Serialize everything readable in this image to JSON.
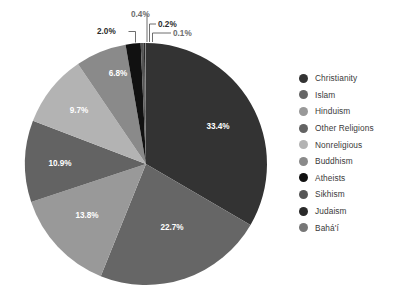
{
  "chart_data": {
    "type": "pie",
    "title": "",
    "subtitle": "",
    "xlabel": "",
    "ylabel": "",
    "grid": false,
    "legend_position": "right",
    "start_angle_deg": 0,
    "direction": "clockwise",
    "units": "percent",
    "categories": [
      "Christianity",
      "Islam",
      "Hinduism",
      "Other Religions",
      "Nonreligious",
      "Buddhism",
      "Atheists",
      "Sikhism",
      "Judaism",
      "Bahá'í"
    ],
    "values": [
      33.4,
      22.7,
      13.8,
      10.9,
      9.7,
      6.8,
      2.0,
      0.4,
      0.2,
      0.1
    ],
    "labels": [
      "33.4%",
      "22.7%",
      "13.8%",
      "10.9%",
      "9.7%",
      "6.8%",
      "2.0%",
      "0.4%",
      "0.2%",
      "0.1%"
    ],
    "colors": [
      "#333333",
      "#666666",
      "#999999",
      "#636363",
      "#b3b3b3",
      "#8a8a8a",
      "#111111",
      "#555555",
      "#2a2a2a",
      "#777777"
    ],
    "label_placement": [
      "inside",
      "inside",
      "inside",
      "inside",
      "inside",
      "inside",
      "outside",
      "outside",
      "outside",
      "outside"
    ]
  },
  "legend": {
    "items": [
      {
        "label": "Christianity",
        "color": "#333333"
      },
      {
        "label": "Islam",
        "color": "#666666"
      },
      {
        "label": "Hinduism",
        "color": "#999999"
      },
      {
        "label": "Other Religions",
        "color": "#636363"
      },
      {
        "label": "Nonreligious",
        "color": "#b3b3b3"
      },
      {
        "label": "Buddhism",
        "color": "#8a8a8a"
      },
      {
        "label": "Atheists",
        "color": "#111111"
      },
      {
        "label": "Sikhism",
        "color": "#555555"
      },
      {
        "label": "Judaism",
        "color": "#2a2a2a"
      },
      {
        "label": "Bahá'í",
        "color": "#777777"
      }
    ]
  },
  "callouts": {
    "c_2_0": "2.0%",
    "c_0_4": "0.4%",
    "c_0_2": "0.2%",
    "c_0_1": "0.1%"
  },
  "slice_labels": {
    "s0": "33.4%",
    "s1": "22.7%",
    "s2": "13.8%",
    "s3": "10.9%",
    "s4": "9.7%",
    "s5": "6.8%"
  }
}
